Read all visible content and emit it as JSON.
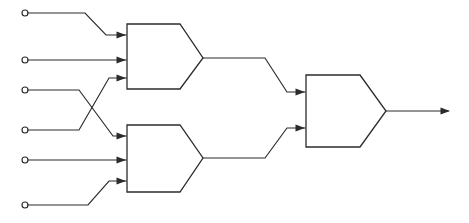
{
  "diagram": {
    "type": "logic-circuit-schematic",
    "canvas": {
      "width": 469,
      "height": 223,
      "background": "#ffffff"
    },
    "stroke_color": "#2b2b2b",
    "stroke_width": 1.15,
    "inputs": [
      {
        "id": "in1",
        "terminal_x": 25,
        "terminal_y": 13,
        "radius": 3,
        "label": ""
      },
      {
        "id": "in2",
        "terminal_x": 25,
        "terminal_y": 60,
        "radius": 3,
        "label": ""
      },
      {
        "id": "in3",
        "terminal_x": 25,
        "terminal_y": 90,
        "radius": 3,
        "label": ""
      },
      {
        "id": "in4",
        "terminal_x": 25,
        "terminal_y": 130,
        "radius": 3,
        "label": ""
      },
      {
        "id": "in5",
        "terminal_x": 25,
        "terminal_y": 160,
        "radius": 3,
        "label": ""
      },
      {
        "id": "in6",
        "terminal_x": 25,
        "terminal_y": 205,
        "radius": 3,
        "label": ""
      }
    ],
    "gates": [
      {
        "id": "gate1",
        "name": "upper-gate",
        "left": 127,
        "top": 24,
        "bottom": 89,
        "apex_x": 203,
        "apex_y": 58,
        "nose_start_x": 180,
        "input_ports": [
          {
            "id": "g1-in-a",
            "x": 127,
            "y": 35
          },
          {
            "id": "g1-in-b",
            "x": 127,
            "y": 60
          },
          {
            "id": "g1-in-c",
            "x": 127,
            "y": 78
          }
        ],
        "output_port": {
          "x": 203,
          "y": 58
        }
      },
      {
        "id": "gate2",
        "name": "lower-gate",
        "left": 127,
        "top": 125,
        "bottom": 192,
        "apex_x": 203,
        "apex_y": 158,
        "nose_start_x": 180,
        "input_ports": [
          {
            "id": "g2-in-a",
            "x": 127,
            "y": 136
          },
          {
            "id": "g2-in-b",
            "x": 127,
            "y": 160
          },
          {
            "id": "g2-in-c",
            "x": 127,
            "y": 181
          }
        ],
        "output_port": {
          "x": 203,
          "y": 158
        }
      },
      {
        "id": "gate3",
        "name": "output-gate",
        "left": 306,
        "top": 75,
        "bottom": 147,
        "apex_x": 386,
        "apex_y": 111,
        "nose_start_x": 360,
        "input_ports": [
          {
            "id": "g3-in-a",
            "x": 306,
            "y": 92
          },
          {
            "id": "g3-in-b",
            "x": 306,
            "y": 128
          }
        ],
        "output_port": {
          "x": 386,
          "y": 111
        }
      }
    ],
    "wires": [
      {
        "id": "w-in1",
        "from": "in1",
        "to": "g1-in-a",
        "path": "M 28 13 L 85 13 L 106 35 L 126 35",
        "crossing": false
      },
      {
        "id": "w-in2",
        "from": "in2",
        "to": "g1-in-b",
        "path": "M 28 60 L 126 60",
        "crossing": false
      },
      {
        "id": "w-in3",
        "from": "in3",
        "to": "g2-in-a",
        "path": "M 28 90 L 79 90 L 113 136 L 126 136",
        "crossing": true
      },
      {
        "id": "w-in4",
        "from": "in4",
        "to": "g1-in-c",
        "path": "M 28 130 L 79 130 L 109 78 L 126 78",
        "crossing": true
      },
      {
        "id": "w-in5",
        "from": "in5",
        "to": "g2-in-b",
        "path": "M 28 160 L 126 160",
        "crossing": false
      },
      {
        "id": "w-in6",
        "from": "in6",
        "to": "g2-in-c",
        "path": "M 28 205 L 88 205 L 109 181 L 126 181",
        "crossing": false
      },
      {
        "id": "w-g1-out",
        "from": "gate1",
        "to": "g3-in-a",
        "path": "M 203 58 L 265 58 L 287 92 L 305 92",
        "crossing": false
      },
      {
        "id": "w-g2-out",
        "from": "gate2",
        "to": "g3-in-b",
        "path": "M 203 158 L 265 158 L 287 128 L 305 128",
        "crossing": false
      },
      {
        "id": "w-g3-out",
        "from": "gate3",
        "to": "output",
        "path": "M 386 111 L 448 111",
        "crossing": false
      }
    ],
    "output": {
      "id": "out1",
      "x": 452,
      "y": 111,
      "label": ""
    },
    "arrowheads": [
      {
        "id": "ah-g1-a",
        "x": 126,
        "y": 35,
        "direction": "right"
      },
      {
        "id": "ah-g1-b",
        "x": 126,
        "y": 60,
        "direction": "right"
      },
      {
        "id": "ah-g1-c",
        "x": 126,
        "y": 78,
        "direction": "right"
      },
      {
        "id": "ah-g2-a",
        "x": 126,
        "y": 136,
        "direction": "right"
      },
      {
        "id": "ah-g2-b",
        "x": 126,
        "y": 160,
        "direction": "right"
      },
      {
        "id": "ah-g2-c",
        "x": 126,
        "y": 181,
        "direction": "right"
      },
      {
        "id": "ah-g3-a",
        "x": 305,
        "y": 92,
        "direction": "right"
      },
      {
        "id": "ah-g3-b",
        "x": 305,
        "y": 128,
        "direction": "right"
      },
      {
        "id": "ah-out",
        "x": 450,
        "y": 111,
        "direction": "right"
      }
    ]
  }
}
